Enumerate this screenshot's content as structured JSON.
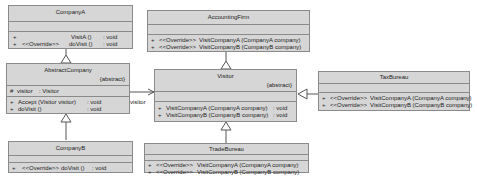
{
  "classes": {
    "companyA": {
      "name": "CompanyA",
      "methods": [
        {
          "vis": "+",
          "stereo": "",
          "sig": "VisitA ()",
          "ret": ": void"
        },
        {
          "vis": "+",
          "stereo": "<<Override>>",
          "sig": "doVisit ()",
          "ret": ": void"
        }
      ]
    },
    "abstractCompany": {
      "name": "AbstractCompany",
      "modifier": "{abstract}",
      "attributes": [
        {
          "vis": "#",
          "name": "visitor",
          "type": ": Visitor"
        }
      ],
      "methods": [
        {
          "vis": "+",
          "sig": "Accept (Visitor visitor)",
          "ret": ": void"
        },
        {
          "vis": "+",
          "sig": "doVisit ()",
          "ret": ": void"
        }
      ]
    },
    "companyB": {
      "name": "CompanyB",
      "methods": [
        {
          "vis": "+",
          "stereo": "<<Override>>",
          "sig": "doVisit ()",
          "ret": ": void"
        }
      ]
    },
    "accountingFirm": {
      "name": "AccountingFirm",
      "methods": [
        {
          "vis": "+",
          "stereo": "<<Override>>",
          "sig": "VisitCompanyA (CompanyA company)"
        },
        {
          "vis": "+",
          "stereo": "<<Override>>",
          "sig": "VisitCompanyB (CompanyB company)"
        }
      ]
    },
    "visitor": {
      "name": "Visitor",
      "modifier": "{abstract}",
      "methods": [
        {
          "vis": "+",
          "sig": "VisitCompanyA (CompanyA company)",
          "ret": ": void"
        },
        {
          "vis": "+",
          "sig": "VisitCompanyB (CompanyB company)",
          "ret": ": void"
        }
      ]
    },
    "tradeBureau": {
      "name": "TradeBureau",
      "methods": [
        {
          "vis": "+",
          "stereo": "<<Override>>",
          "sig": "VisitCompanyA (CompanyA company)"
        },
        {
          "vis": "+",
          "stereo": "<<Override>>",
          "sig": "VisitCompanyB (CompanyB company)"
        }
      ]
    },
    "taxBureau": {
      "name": "TaxBureau",
      "methods": [
        {
          "vis": "+",
          "stereo": "<<Override>>",
          "sig": "VisitCompanyA (CompanyA company)"
        },
        {
          "vis": "+",
          "stereo": "<<Override>>",
          "sig": "VisitCompanyB (CompanyB company)"
        }
      ]
    }
  },
  "associations": {
    "visitor_role": "visitor"
  },
  "colors": {
    "class_fill": "#d6d6d6",
    "class_border": "#8a8a8a",
    "line": "#555555"
  }
}
